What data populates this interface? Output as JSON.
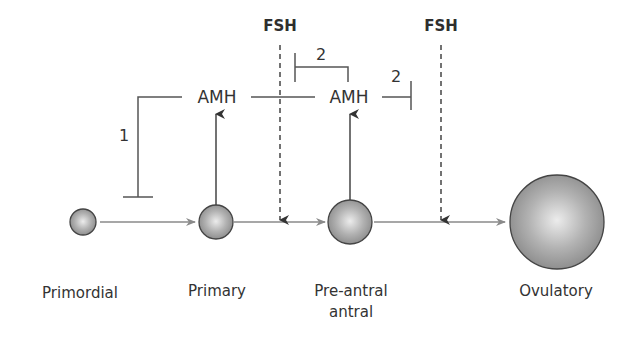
{
  "diagram": {
    "type": "follicle development pathway",
    "hormones": {
      "amh_left": "AMH",
      "amh_right": "AMH",
      "fsh_left": "FSH",
      "fsh_right": "FSH"
    },
    "inhibition_labels": {
      "one": "1",
      "two_upper": "2",
      "two_right": "2"
    },
    "stages": [
      {
        "label": "Primordial"
      },
      {
        "label": "Primary"
      },
      {
        "label": "Pre-antral",
        "label_line2": "antral"
      },
      {
        "label": "Ovulatory"
      }
    ],
    "colors": {
      "line": "#555555",
      "arrow_gray": "#8a8a8a",
      "sphere_light": "#e6e6e6",
      "sphere_dark": "#8c8c8c",
      "text": "#333333"
    }
  }
}
